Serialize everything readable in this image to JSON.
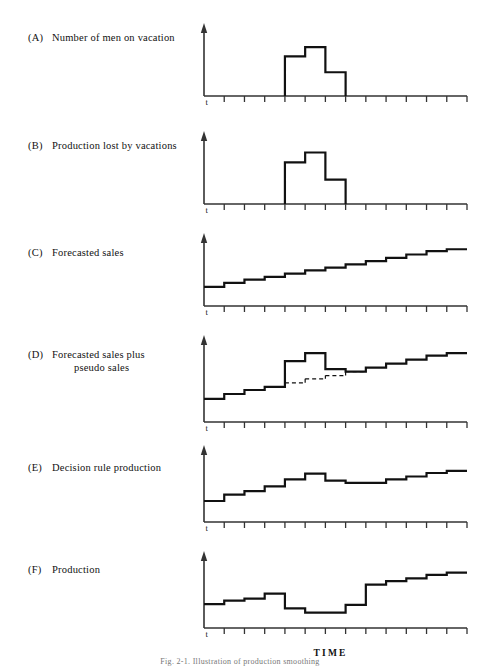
{
  "figure": {
    "caption": "Fig. 2-1. Illustration of production smoothing",
    "time_axis_label": "TIME",
    "t_marker": "t",
    "line_color": "#111111",
    "axis_color": "#333333",
    "background": "#ffffff"
  },
  "chart_data": {
    "type": "line",
    "xlabel": "TIME",
    "ylabel": "",
    "grid": false,
    "legend": null,
    "x_ticks": 13,
    "x_range": [
      0,
      13
    ],
    "panels": [
      {
        "id": "A",
        "tag": "(A)",
        "label": "Number of men on vacation",
        "label_line2": "",
        "style": "pulse",
        "ylim": [
          0,
          10
        ],
        "values": [
          0,
          0,
          0,
          0,
          6.0,
          7.4,
          3.6,
          0,
          0,
          0,
          0,
          0,
          0
        ]
      },
      {
        "id": "B",
        "tag": "(B)",
        "label": "Production lost by vacations",
        "label_line2": "",
        "style": "pulse",
        "ylim": [
          0,
          10
        ],
        "values": [
          0,
          0,
          0,
          0,
          6.3,
          7.8,
          3.7,
          0,
          0,
          0,
          0,
          0,
          0
        ]
      },
      {
        "id": "C",
        "tag": "(C)",
        "label": "Forecasted sales",
        "label_line2": "",
        "style": "step",
        "ylim": [
          0,
          10
        ],
        "values": [
          2.9,
          3.5,
          4.0,
          4.4,
          4.9,
          5.4,
          5.8,
          6.3,
          6.8,
          7.3,
          7.8,
          8.3,
          8.6
        ]
      },
      {
        "id": "D",
        "tag": "(D)",
        "label": "Forecasted sales plus",
        "label_line2": "pseudo sales",
        "style": "step-with-pseudo",
        "ylim": [
          0,
          10
        ],
        "values": [
          2.9,
          3.5,
          4.0,
          4.4,
          7.6,
          8.6,
          6.6,
          6.3,
          6.8,
          7.3,
          7.8,
          8.3,
          8.6
        ],
        "baseline": [
          2.9,
          3.5,
          4.0,
          4.4,
          4.9,
          5.4,
          5.8,
          6.3,
          6.8,
          7.3,
          7.8,
          8.3,
          8.6
        ],
        "pseudo_from": 4,
        "pseudo_to": 7
      },
      {
        "id": "E",
        "tag": "(E)",
        "label": "Decision rule production",
        "label_line2": "",
        "style": "step",
        "ylim": [
          0,
          10
        ],
        "values": [
          3.0,
          3.9,
          4.4,
          5.1,
          6.1,
          6.9,
          5.9,
          5.6,
          5.6,
          6.1,
          6.5,
          7.0,
          7.3
        ]
      },
      {
        "id": "F",
        "tag": "(F)",
        "label": "Production",
        "label_line2": "",
        "style": "step",
        "ylim": [
          0,
          10
        ],
        "values": [
          3.4,
          3.9,
          4.2,
          4.9,
          2.8,
          2.2,
          2.2,
          3.3,
          6.2,
          6.7,
          7.1,
          7.6,
          7.9
        ]
      }
    ]
  }
}
